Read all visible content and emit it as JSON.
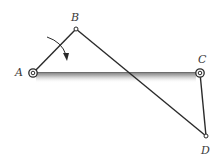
{
  "diagram": {
    "type": "four-bar linkage",
    "points": {
      "A": {
        "label": "A",
        "x": 33,
        "y": 73
      },
      "B": {
        "label": "B",
        "x": 76,
        "y": 29
      },
      "C": {
        "label": "C",
        "x": 200,
        "y": 73
      },
      "D": {
        "label": "D",
        "x": 206,
        "y": 136
      }
    },
    "links": [
      {
        "from": "A",
        "to": "B"
      },
      {
        "from": "B",
        "to": "D"
      },
      {
        "from": "C",
        "to": "D"
      }
    ],
    "ground": {
      "from": "A",
      "to": "C",
      "style": "shaded-bar"
    },
    "moment_arrow": {
      "direction": "clockwise",
      "near": "AB"
    },
    "colors": {
      "link": "#2a2a2a",
      "ground_top": "#7a7a7a",
      "ground_bottom": "#e6e6e6",
      "label": "#3a3a3a"
    }
  }
}
